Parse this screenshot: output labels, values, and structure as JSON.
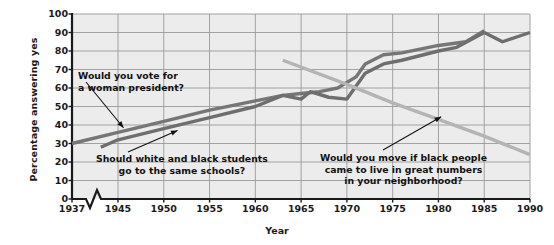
{
  "chart_data": {
    "type": "line",
    "title": "",
    "xlabel": "Year",
    "ylabel": "Percentage answering yes",
    "xlim": [
      1937,
      1990
    ],
    "ylim": [
      0,
      100
    ],
    "grid": true,
    "legend_position": "none",
    "axis_break": "zigzag between 1937 and 1945 on x-axis",
    "xticks": [
      1937,
      1945,
      1950,
      1955,
      1960,
      1965,
      1970,
      1975,
      1980,
      1985,
      1990
    ],
    "xtick_labels": [
      "1937",
      "1945",
      "1950",
      "1955",
      "1960",
      "1965",
      "1970",
      "1975",
      "1980",
      "1985",
      "1990"
    ],
    "yticks": [
      0,
      10,
      20,
      30,
      40,
      50,
      60,
      70,
      80,
      90,
      100
    ],
    "ytick_labels": [
      "0",
      "10",
      "20",
      "30",
      "40",
      "50",
      "60",
      "70",
      "80",
      "90",
      "100"
    ],
    "colors": {
      "woman_president": "#767676",
      "same_schools": "#6e6e6e",
      "would_move": "#b4b4b4",
      "grid": "#9a9a9a",
      "axis": "#1a1a1a",
      "plot_background": "#ececec"
    },
    "series": [
      {
        "name": "Would you vote for a woman president?",
        "color": "#767676",
        "x": [
          1937,
          1945,
          1950,
          1955,
          1960,
          1963,
          1965,
          1967,
          1969,
          1971,
          1972,
          1974,
          1976,
          1978,
          1980,
          1983,
          1985
        ],
        "values": [
          30,
          36,
          42,
          48,
          53,
          56,
          57,
          58,
          60,
          66,
          73,
          78,
          79,
          81,
          83,
          85,
          91
        ]
      },
      {
        "name": "Should white and black students go to the same schools?",
        "color": "#6e6e6e",
        "x": [
          1942,
          1945,
          1950,
          1955,
          1960,
          1963,
          1965,
          1966,
          1968,
          1970,
          1972,
          1974,
          1976,
          1980,
          1982,
          1985,
          1987,
          1990
        ],
        "values": [
          28,
          32,
          38,
          44,
          50,
          56,
          54,
          58,
          55,
          54,
          68,
          73,
          75,
          80,
          82,
          90,
          85,
          90
        ]
      },
      {
        "name": "Would you move if black people came to live in great numbers in your neighborhood?",
        "color": "#b4b4b4",
        "x": [
          1963,
          1970,
          1975,
          1980,
          1985,
          1990
        ],
        "values": [
          75,
          62,
          52,
          43,
          34,
          24
        ]
      }
    ],
    "annotations": [
      {
        "id": "woman-president",
        "lines": [
          "Would you vote for",
          "a woman president?"
        ],
        "points_to": {
          "x": 1945,
          "y": 38
        }
      },
      {
        "id": "same-schools",
        "lines": [
          "Should white and black students",
          "go to the same schools?"
        ],
        "points_to": {
          "x": 1951,
          "y": 36
        }
      },
      {
        "id": "would-move",
        "lines": [
          "Would you move if black people",
          "came to live in great numbers",
          "in your neighborhood?"
        ],
        "points_to": {
          "x": 1980,
          "y": 44
        }
      }
    ]
  }
}
